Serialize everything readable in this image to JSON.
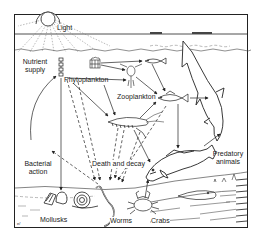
{
  "diagram": {
    "title": "",
    "colors": {
      "ink": "#222222",
      "paper": "#ffffff",
      "faint": "#888888"
    },
    "labels": {
      "light": "Light",
      "nutrient_supply_1": "Nutrient",
      "nutrient_supply_2": "supply",
      "phytoplankton": "Phytoplankton",
      "zooplankton": "Zooplankton",
      "bacterial_action_1": "Bacterial",
      "bacterial_action_2": "action",
      "death_and_decay": "Death and decay",
      "predatory_animals_1": "Predatory",
      "predatory_animals_2": "animals",
      "mollusks": "Mollusks",
      "worms": "Worms",
      "crabs": "Crabs"
    },
    "nodes": [
      {
        "id": "sun",
        "icon": "sun-icon"
      },
      {
        "id": "nutrient_supply",
        "icon": "nutrient-column-icon"
      },
      {
        "id": "phytoplankton",
        "icon": "phytoplankton-icon"
      },
      {
        "id": "zooplankton",
        "icon": "copepod-icon"
      },
      {
        "id": "small_fish",
        "icon": "fish-icon"
      },
      {
        "id": "medium_fish",
        "icon": "fish-icon"
      },
      {
        "id": "shrimp",
        "icon": "shrimp-icon"
      },
      {
        "id": "shark",
        "icon": "shark-icon"
      },
      {
        "id": "cod",
        "icon": "fish-icon"
      },
      {
        "id": "flatfish",
        "icon": "flatfish-icon"
      },
      {
        "id": "mollusks",
        "icon": "snail-icon"
      },
      {
        "id": "worms",
        "icon": "worm-icon"
      },
      {
        "id": "crabs",
        "icon": "crab-icon"
      }
    ],
    "edges": [
      {
        "from": "phytoplankton",
        "to": "zooplankton",
        "style": "solid"
      },
      {
        "from": "phytoplankton",
        "to": "small_fish",
        "style": "solid"
      },
      {
        "from": "phytoplankton",
        "to": "shrimp",
        "style": "solid"
      },
      {
        "from": "zooplankton",
        "to": "medium_fish",
        "style": "solid"
      },
      {
        "from": "small_fish",
        "to": "medium_fish",
        "style": "solid"
      },
      {
        "from": "shrimp",
        "to": "medium_fish",
        "style": "solid"
      },
      {
        "from": "medium_fish",
        "to": "shark",
        "style": "solid"
      },
      {
        "from": "medium_fish",
        "to": "cod",
        "style": "solid"
      },
      {
        "from": "cod",
        "to": "shark",
        "style": "solid"
      },
      {
        "from": "phytoplankton",
        "to": "mollusks",
        "style": "solid"
      },
      {
        "from": "shrimp",
        "to": "cod",
        "style": "solid"
      },
      {
        "from": "crabs",
        "to": "cod",
        "style": "solid"
      },
      {
        "from": "bacterial_action",
        "to": "nutrient_supply",
        "style": "solid"
      },
      {
        "from": "phytoplankton",
        "to": "sea_floor",
        "style": "dashed"
      },
      {
        "from": "shrimp",
        "to": "sea_floor",
        "style": "dashed"
      },
      {
        "from": "medium_fish",
        "to": "sea_floor",
        "style": "dashed"
      },
      {
        "from": "sea_floor",
        "to": "bacterial_action",
        "style": "dashed"
      }
    ]
  }
}
